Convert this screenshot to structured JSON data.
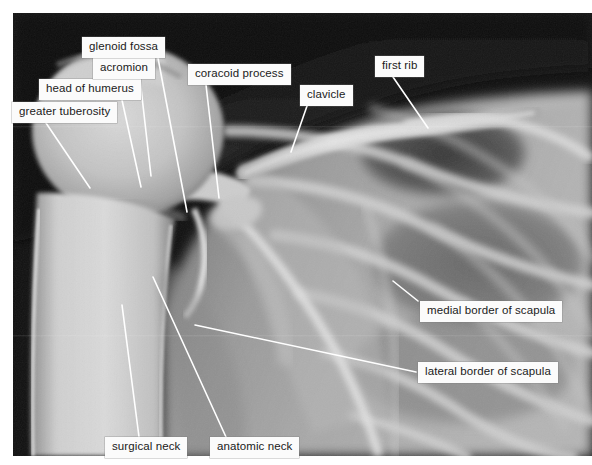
{
  "figure": {
    "kind": "radiograph",
    "plate": {
      "x": 13,
      "y": 13,
      "width": 579,
      "height": 443
    },
    "background_color": "#ffffff",
    "label_box_color": "#fbfbfb",
    "label_text_color": "#1a1a1a",
    "leader_line_color": "#ffffff"
  },
  "labels": [
    {
      "id": "greater-tuberosity",
      "text": "greater tuberosity",
      "box": {
        "x": 12,
        "y": 102,
        "w": 108,
        "h": 19
      },
      "leader": {
        "x1": 46,
        "y1": 123,
        "x2": 90,
        "y2": 188
      }
    },
    {
      "id": "head-of-humerus",
      "text": "head of humerus",
      "box": {
        "x": 39,
        "y": 79,
        "w": 103,
        "h": 19
      },
      "leader": {
        "x1": 122,
        "y1": 100,
        "x2": 141,
        "y2": 187
      }
    },
    {
      "id": "acromion",
      "text": "acromion",
      "box": {
        "x": 93,
        "y": 58,
        "w": 66,
        "h": 19
      },
      "leader": {
        "x1": 140,
        "y1": 79,
        "x2": 151,
        "y2": 176
      }
    },
    {
      "id": "glenoid-fossa",
      "text": "glenoid fossa",
      "box": {
        "x": 82,
        "y": 37,
        "w": 85,
        "h": 19
      },
      "leader": {
        "x1": 158,
        "y1": 58,
        "x2": 187,
        "y2": 212
      }
    },
    {
      "id": "coracoid-process",
      "text": "coracoid process",
      "box": {
        "x": 188,
        "y": 64,
        "w": 104,
        "h": 19
      },
      "leader": {
        "x1": 206,
        "y1": 85,
        "x2": 219,
        "y2": 198
      }
    },
    {
      "id": "clavicle",
      "text": "clavicle",
      "box": {
        "x": 300,
        "y": 85,
        "w": 57,
        "h": 19
      },
      "leader": {
        "x1": 307,
        "y1": 106,
        "x2": 291,
        "y2": 152
      }
    },
    {
      "id": "first-rib",
      "text": "first rib",
      "box": {
        "x": 375,
        "y": 56,
        "w": 59,
        "h": 19
      },
      "leader": {
        "x1": 393,
        "y1": 77,
        "x2": 428,
        "y2": 128
      }
    },
    {
      "id": "medial-border-of-scapula",
      "text": "medial border of scapula",
      "box": {
        "x": 420,
        "y": 301,
        "w": 147,
        "h": 20
      },
      "leader": {
        "x1": 418,
        "y1": 301,
        "x2": 393,
        "y2": 281
      }
    },
    {
      "id": "lateral-border-of-scapula",
      "text": "lateral border of scapula",
      "box": {
        "x": 418,
        "y": 362,
        "w": 145,
        "h": 20
      },
      "leader": {
        "x1": 416,
        "y1": 372,
        "x2": 195,
        "y2": 325
      }
    },
    {
      "id": "surgical-neck",
      "text": "surgical neck",
      "box": {
        "x": 105,
        "y": 437,
        "w": 84,
        "h": 19
      },
      "leader": {
        "x1": 139,
        "y1": 437,
        "x2": 122,
        "y2": 305
      }
    },
    {
      "id": "anatomic-neck",
      "text": "anatomic neck",
      "box": {
        "x": 210,
        "y": 437,
        "w": 90,
        "h": 19
      },
      "leader": {
        "x1": 226,
        "y1": 437,
        "x2": 153,
        "y2": 277
      }
    }
  ]
}
